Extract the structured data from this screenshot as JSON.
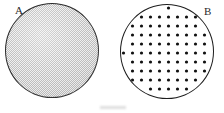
{
  "figure": {
    "background_color": "#ffffff",
    "width": 224,
    "height": 113,
    "specimens": [
      {
        "id": "A",
        "label": "A",
        "fill_style": "stippled-gray-halftone",
        "fill_color": "#dadada",
        "outline_color": "#2b2b2b",
        "center_x": 52,
        "center_y": 50,
        "diameter": 94,
        "dot_count": 0
      },
      {
        "id": "B",
        "label": "B",
        "fill_style": "black-dot-lattice",
        "fill_color": "#ffffff",
        "outline_color": "#1d1d1d",
        "dot_color": "#111111",
        "center_x": 167,
        "center_y": 51,
        "diameter": 94,
        "dot_radius": 1.6,
        "dot_pitch": 9
      }
    ]
  }
}
